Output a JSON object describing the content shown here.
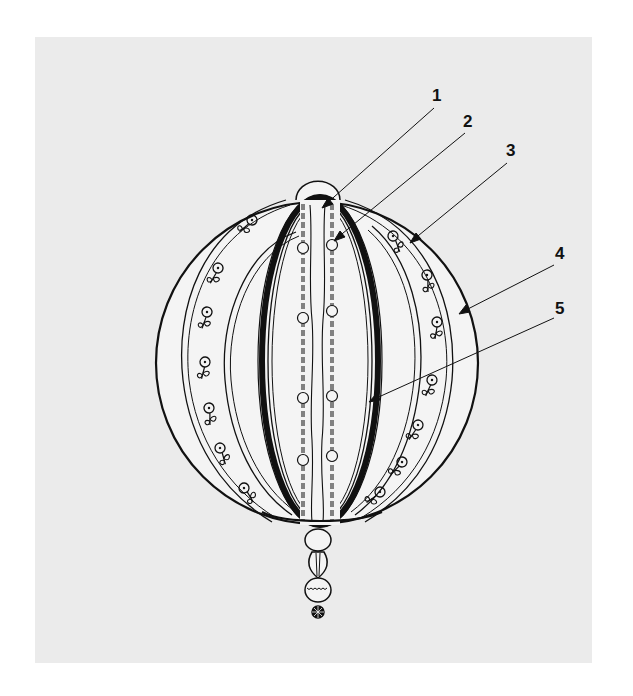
{
  "figure": {
    "background_color": "#ebebeb",
    "line_color": "#111111"
  },
  "callouts": [
    {
      "label": "1",
      "x": 438,
      "y": 101,
      "line_from": [
        434,
        108
      ],
      "line_to": [
        325,
        205
      ]
    },
    {
      "label": "2",
      "x": 469,
      "y": 127,
      "line_from": [
        465,
        133
      ],
      "line_to": [
        337,
        238
      ]
    },
    {
      "label": "3",
      "x": 512,
      "y": 156,
      "line_from": [
        507,
        163
      ],
      "line_to": [
        413,
        240
      ]
    },
    {
      "label": "4",
      "x": 561,
      "y": 259,
      "line_from": [
        554,
        265
      ],
      "line_to": [
        462,
        312
      ]
    },
    {
      "label": "5",
      "x": 561,
      "y": 314,
      "line_from": [
        554,
        318
      ],
      "line_to": [
        372,
        400
      ]
    }
  ]
}
